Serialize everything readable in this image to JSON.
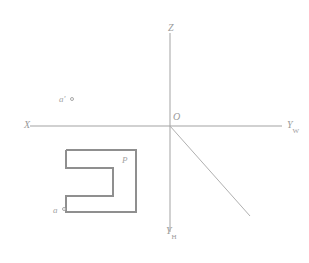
{
  "figure": {
    "name": "orthographic-projection-sketch",
    "background_color": "#ffffff",
    "line_color": "#9b9b9b",
    "shape_color": "#8f8f8f",
    "text_color": "#9a9a9a",
    "width": 309,
    "height": 263
  },
  "axes": {
    "horizontal": {
      "left_label": "X",
      "right_label_base": "Y",
      "right_label_sub": "W",
      "x1": 30,
      "x2": 282,
      "y": 126
    },
    "vertical": {
      "top_label": "Z",
      "bottom_label_base": "Y",
      "bottom_label_sub": "H",
      "x": 170,
      "y1": 33,
      "y2": 232
    },
    "diagonal": {
      "x1": 170,
      "y1": 126,
      "x2": 250,
      "y2": 216
    },
    "origin_label": "O"
  },
  "labels": {
    "front_view_point": "a'",
    "top_view_point": "a",
    "shape_label": "P"
  },
  "shape": {
    "name": "c-shaped-polygon",
    "outline_points": "66,150 136,150 136,212 66,212 66,196 113,196 113,168 66,168 66,150",
    "stroke_width": 2
  },
  "markers": {
    "front_view_dot": {
      "x": 72,
      "y": 99
    },
    "top_view_dot": {
      "x": 64,
      "y": 209
    }
  }
}
